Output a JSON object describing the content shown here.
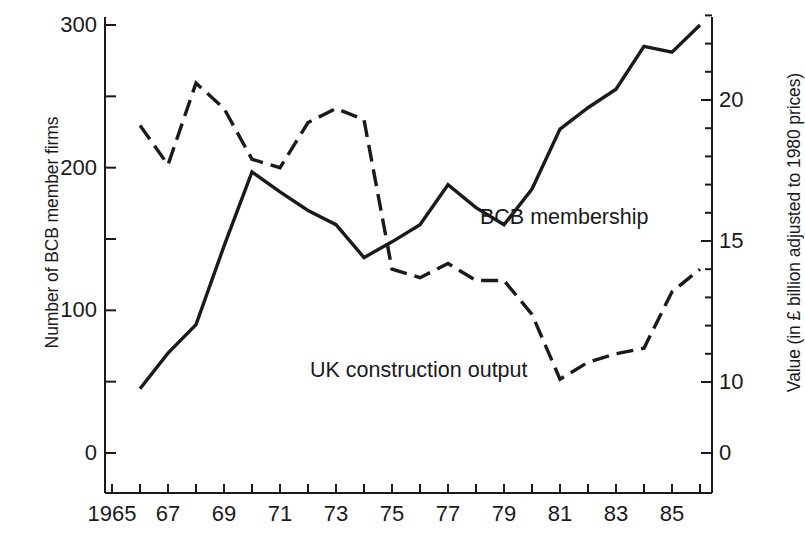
{
  "chart_data": {
    "type": "line",
    "title": "",
    "xlabel": "",
    "ylabel": "Number of BCB member firms",
    "y2label": "Value (in £ billion adjusted to 1980 prices)",
    "grid": false,
    "legend_position": "inline-annotation",
    "x": [
      1965,
      1966,
      1967,
      1968,
      1969,
      1970,
      1971,
      1972,
      1973,
      1974,
      1975,
      1976,
      1977,
      1978,
      1979,
      1980,
      1981,
      1982,
      1983,
      1984,
      1985,
      1986
    ],
    "xlim": [
      1965,
      1986
    ],
    "xtick_values": [
      1965,
      1966,
      1967,
      1968,
      1969,
      1970,
      1971,
      1972,
      1973,
      1974,
      1975,
      1976,
      1977,
      1978,
      1979,
      1980,
      1981,
      1982,
      1983,
      1984,
      1985,
      1986
    ],
    "xtick_labels": [
      "1965",
      "",
      "67",
      "",
      "69",
      "",
      "71",
      "",
      "73",
      "",
      "75",
      "",
      "77",
      "",
      "79",
      "",
      "81",
      "",
      "83",
      "",
      "85",
      ""
    ],
    "ylim": [
      0,
      300
    ],
    "ytick_values": [
      0,
      50,
      100,
      150,
      200,
      250,
      300
    ],
    "ytick_labels": [
      "0",
      "",
      "100",
      "",
      "200",
      "",
      "300"
    ],
    "y2_tick_values": [
      0,
      10,
      11,
      12,
      13,
      14,
      15,
      16,
      17,
      18,
      19,
      20,
      21,
      22,
      23
    ],
    "y2_tick_labels": [
      "0",
      "10",
      "",
      "",
      "",
      "",
      "15",
      "",
      "",
      "",
      "",
      "20",
      "",
      "",
      ""
    ],
    "series": [
      {
        "name": "BCB membership",
        "axis": "left",
        "style": "solid",
        "color": "#1a1a1a",
        "label_text": "BCB membership",
        "x": [
          1966,
          1967,
          1968,
          1969,
          1970,
          1971,
          1972,
          1973,
          1974,
          1975,
          1976,
          1977,
          1978,
          1979,
          1980,
          1981,
          1982,
          1983,
          1984,
          1985,
          1986
        ],
        "values": [
          45,
          70,
          90,
          145,
          197,
          183,
          170,
          160,
          137,
          148,
          160,
          188,
          172,
          160,
          185,
          227,
          242,
          255,
          285,
          281,
          300
        ]
      },
      {
        "name": "UK construction output",
        "axis": "right",
        "style": "dashed",
        "color": "#1a1a1a",
        "label_text": "UK construction output",
        "x": [
          1966,
          1967,
          1968,
          1969,
          1970,
          1971,
          1972,
          1973,
          1974,
          1975,
          1976,
          1977,
          1978,
          1979,
          1980,
          1981,
          1982,
          1983,
          1984,
          1985,
          1986
        ],
        "values": [
          19.1,
          17.7,
          20.6,
          19.7,
          17.9,
          17.6,
          19.2,
          19.7,
          19.3,
          14.0,
          13.7,
          14.2,
          13.6,
          13.6,
          12.4,
          10.1,
          10.7,
          11.0,
          11.2,
          13.2,
          14.0
        ]
      }
    ],
    "annotations": [
      {
        "text": "BCB membership",
        "x_px": 480,
        "y_px": 224
      },
      {
        "text": "UK construction output",
        "x_px": 310,
        "y_px": 377
      }
    ]
  },
  "axes": {
    "left_title": "Number of BCB member firms",
    "right_title": "Value (in £ billion adjusted to 1980 prices)"
  },
  "labels": {
    "series_solid": "BCB membership",
    "series_dashed": "UK construction output"
  }
}
